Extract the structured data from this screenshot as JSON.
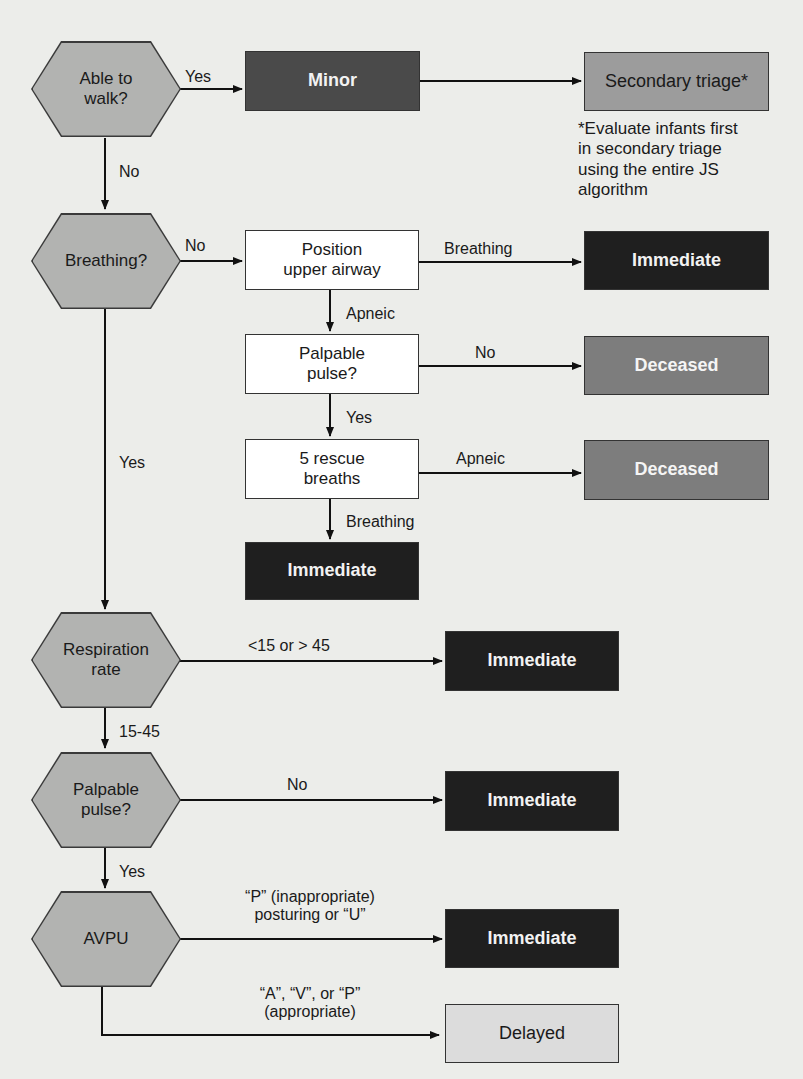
{
  "diagram": {
    "decisions": {
      "walk": "Able to\nwalk?",
      "breathing": "Breathing?",
      "respiration": "Respiration\nrate",
      "pulse": "Palpable\npulse?",
      "avpu": "AVPU"
    },
    "actions": {
      "position_airway": "Position\nupper airway",
      "palpable_pulse": "Palpable\npulse?",
      "rescue_breaths": "5 rescue\nbreaths"
    },
    "outcomes": {
      "minor": "Minor",
      "secondary": "Secondary triage*",
      "immediate_breathing": "Immediate",
      "deceased_no_pulse": "Deceased",
      "deceased_apneic": "Deceased",
      "immediate_rescue": "Immediate",
      "immediate_rr": "Immediate",
      "immediate_pulse": "Immediate",
      "immediate_avpu": "Immediate",
      "delayed": "Delayed"
    },
    "edge_labels": {
      "walk_yes": "Yes",
      "walk_no": "No",
      "breathing_no": "No",
      "breathing_yes": "Yes",
      "airway_breathing": "Breathing",
      "airway_apneic": "Apneic",
      "pulse_no": "No",
      "pulse_yes": "Yes",
      "rescue_apneic": "Apneic",
      "rescue_breathing": "Breathing",
      "rr_abnormal": "<15 or > 45",
      "rr_normal": "15-45",
      "palp_no": "No",
      "palp_yes": "Yes",
      "avpu_immediate": "“P” (inappropriate)\nposturing or “U”",
      "avpu_delayed": "“A”, “V”, or “P”\n(appropriate)"
    },
    "footnote": "*Evaluate infants first\nin secondary triage\nusing the entire JS\nalgorithm"
  },
  "colors": {
    "background": "#ecedea",
    "decision_fill": "#b2b3b1",
    "minor": "#4a4a4a",
    "immediate": "#1f1f1f",
    "deceased": "#7d7d7d",
    "secondary": "#9c9c9c",
    "delayed": "#dcdcdc"
  }
}
